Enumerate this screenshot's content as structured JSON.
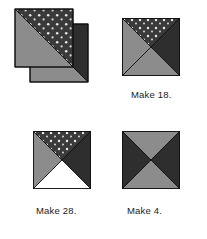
{
  "document": {
    "type": "quilt-block-piecing-diagram",
    "background_color": "#ffffff"
  },
  "palette": {
    "medium_gray": "#8c8c8c",
    "dark_charcoal": "#2e2e2e",
    "dotted_fabric_base": "#3a3a3a",
    "dot_color": "#e8e8e8",
    "white_fabric": "#ffffff",
    "outline": "#111111",
    "text_color": "#1b1b1b"
  },
  "figures": [
    {
      "id": "figure-offset-half-square-pair",
      "name": "offset-half-square-triangle-pair",
      "caption": "",
      "units": [
        {
          "name": "half-square-triangle-dotted-gray",
          "triangles": [
            {
              "position": "upper-right",
              "fabric": "dotted"
            },
            {
              "position": "lower-left",
              "fabric": "medium_gray"
            }
          ]
        },
        {
          "name": "half-square-triangle-dark-gray",
          "triangles": [
            {
              "position": "upper-right",
              "fabric": "dark"
            },
            {
              "position": "lower-left",
              "fabric": "medium_gray"
            }
          ]
        }
      ]
    },
    {
      "id": "figure-make-18",
      "name": "quarter-square-triangle-block-dotted",
      "caption": "Make 18.",
      "quarters": [
        {
          "position": "top",
          "fabric": "dotted"
        },
        {
          "position": "left",
          "fabric": "medium_gray"
        },
        {
          "position": "right",
          "fabric": "dark"
        },
        {
          "position": "bottom",
          "fabric": "medium_gray"
        }
      ]
    },
    {
      "id": "figure-make-28",
      "name": "quarter-square-triangle-block-white-bottom",
      "caption": "Make 28.",
      "quarters": [
        {
          "position": "top",
          "fabric": "dotted"
        },
        {
          "position": "left",
          "fabric": "medium_gray"
        },
        {
          "position": "right",
          "fabric": "dark"
        },
        {
          "position": "bottom",
          "fabric": "white"
        }
      ]
    },
    {
      "id": "figure-make-4",
      "name": "quarter-square-triangle-block-hourglass",
      "caption": "Make 4.",
      "quarters": [
        {
          "position": "top",
          "fabric": "medium_gray"
        },
        {
          "position": "left",
          "fabric": "dark"
        },
        {
          "position": "right",
          "fabric": "dark"
        },
        {
          "position": "bottom",
          "fabric": "medium_gray"
        }
      ]
    }
  ],
  "captions": {
    "make_18": "Make 18.",
    "make_28": "Make 28.",
    "make_4": "Make 4."
  }
}
